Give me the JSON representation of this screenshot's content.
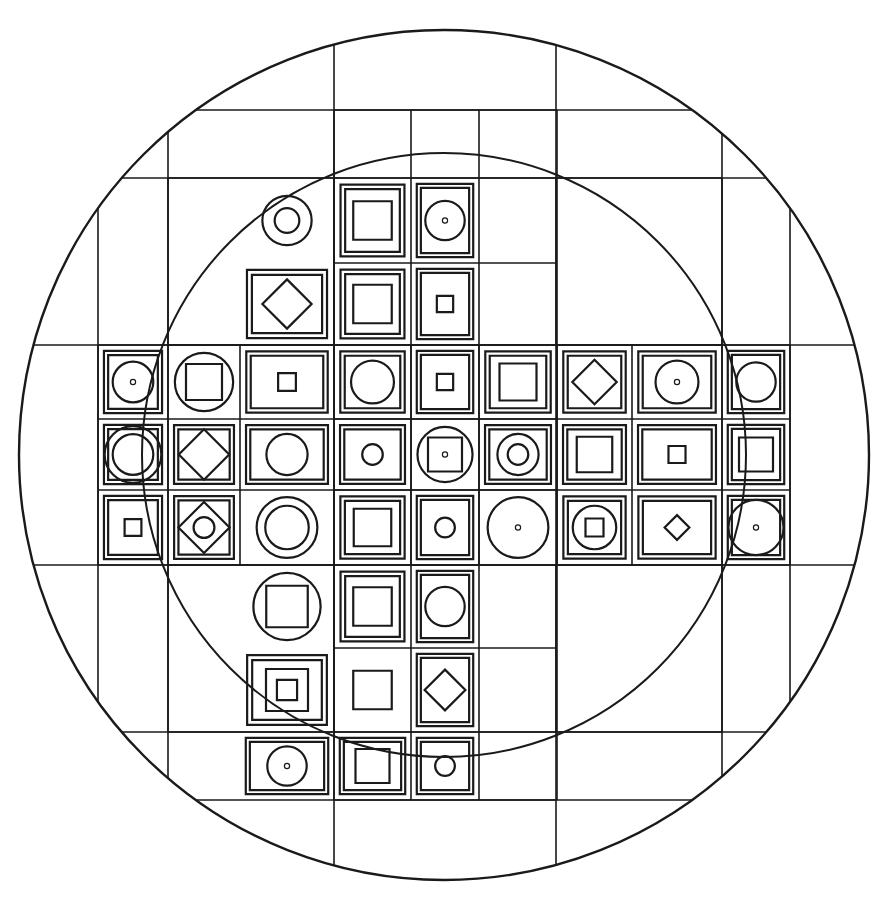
{
  "artwork": {
    "title": "Geometric Mandala Colouring Page",
    "type": "line-art",
    "palette": {
      "background": "#ffffff",
      "ink": "#1a1a1a"
    },
    "canvas": {
      "width": 889,
      "height": 909
    }
  },
  "geometry": {
    "outer_circle": {
      "cx": 444,
      "cy": 455,
      "r": 425,
      "stroke_width": 2.4
    },
    "inner_arc_circle": {
      "cx": 444,
      "cy": 455,
      "r": 302,
      "stroke_width": 2.0
    },
    "corner_squares": [
      {
        "name": "top-left-corner-square",
        "x": 168,
        "y": 178,
        "width": 166,
        "height": 167
      },
      {
        "name": "top-right-corner-square",
        "x": 556,
        "y": 178,
        "width": 166,
        "height": 167
      },
      {
        "name": "bottom-left-corner-square",
        "x": 168,
        "y": 565,
        "width": 166,
        "height": 167
      },
      {
        "name": "bottom-right-corner-square",
        "x": 556,
        "y": 565,
        "width": 166,
        "height": 167
      }
    ],
    "frame_lines": {
      "vertical": [
        98,
        168,
        334,
        556,
        722,
        790
      ],
      "horizontal": [
        110,
        178,
        345,
        565,
        732,
        800
      ]
    },
    "grid": {
      "columns": 9,
      "rows": 9,
      "x_edges": [
        98,
        168,
        240,
        334,
        411,
        479,
        557,
        632,
        722,
        790
      ],
      "y_edges": [
        110,
        178,
        263,
        345,
        419,
        490,
        565,
        648,
        732,
        800
      ],
      "arm_cols": [
        3,
        4,
        5
      ],
      "arm_rows": [
        3,
        4,
        5
      ],
      "description": "Plus/cross shaped tile field: full 9 columns across rows 3-5, full 9 rows within columns 3-5. Corner 3x3 blocks are empty and filled with arcs and nested rectangles."
    }
  },
  "cells": [
    {
      "id": "r0c4",
      "row": 0,
      "col": 4,
      "motifs": [
        "circle"
      ]
    },
    {
      "id": "r1c3",
      "row": 1,
      "col": 3,
      "motifs": [
        "circle",
        "circle-small"
      ]
    },
    {
      "id": "r1c4",
      "row": 1,
      "col": 4,
      "motifs": [
        "square-double",
        "square"
      ]
    },
    {
      "id": "r1c5",
      "row": 1,
      "col": 5,
      "motifs": [
        "square-double",
        "circle",
        "dot"
      ]
    },
    {
      "id": "r2c3",
      "row": 2,
      "col": 3,
      "motifs": [
        "square-double",
        "diamond"
      ]
    },
    {
      "id": "r2c4",
      "row": 2,
      "col": 4,
      "motifs": [
        "square-double",
        "square"
      ]
    },
    {
      "id": "r2c5",
      "row": 2,
      "col": 5,
      "motifs": [
        "square-double",
        "square-small"
      ]
    },
    {
      "id": "r3c0",
      "row": 3,
      "col": 0,
      "motifs": []
    },
    {
      "id": "r3c1",
      "row": 3,
      "col": 1,
      "motifs": [
        "square-double",
        "circle",
        "dot"
      ]
    },
    {
      "id": "r3c2",
      "row": 3,
      "col": 2,
      "motifs": [
        "circle-large",
        "square"
      ]
    },
    {
      "id": "r3c3",
      "row": 3,
      "col": 3,
      "motifs": [
        "square-double",
        "square-small"
      ]
    },
    {
      "id": "r3c4",
      "row": 3,
      "col": 4,
      "motifs": [
        "square-double",
        "circle"
      ]
    },
    {
      "id": "r3c5",
      "row": 3,
      "col": 5,
      "motifs": [
        "square-double",
        "square-small"
      ]
    },
    {
      "id": "r3c6",
      "row": 3,
      "col": 6,
      "motifs": [
        "square-double",
        "square"
      ]
    },
    {
      "id": "r3c7",
      "row": 3,
      "col": 7,
      "motifs": [
        "square-double",
        "diamond"
      ]
    },
    {
      "id": "r3c8",
      "row": 3,
      "col": 8,
      "motifs": [
        "square-double",
        "circle",
        "dot"
      ]
    },
    {
      "id": "r3c9",
      "row": 3,
      "col": 9,
      "motifs": [
        "square-double",
        "circle"
      ]
    },
    {
      "id": "r4c0",
      "row": 4,
      "col": 0,
      "motifs": [
        "circle"
      ]
    },
    {
      "id": "r4c1",
      "row": 4,
      "col": 1,
      "motifs": [
        "square-double",
        "circle-large",
        "circle"
      ]
    },
    {
      "id": "r4c2",
      "row": 4,
      "col": 2,
      "motifs": [
        "square-double",
        "diamond-large"
      ]
    },
    {
      "id": "r4c3",
      "row": 4,
      "col": 3,
      "motifs": [
        "square-double",
        "circle"
      ]
    },
    {
      "id": "r4c4",
      "row": 4,
      "col": 4,
      "motifs": [
        "square-double",
        "circle-small"
      ]
    },
    {
      "id": "r4c5",
      "row": 4,
      "col": 5,
      "motifs": [
        "circle-large",
        "square",
        "dot"
      ]
    },
    {
      "id": "r4c6",
      "row": 4,
      "col": 6,
      "motifs": [
        "square-double",
        "circle",
        "circle-small"
      ]
    },
    {
      "id": "r4c7",
      "row": 4,
      "col": 7,
      "motifs": [
        "square-double",
        "square"
      ]
    },
    {
      "id": "r4c8",
      "row": 4,
      "col": 8,
      "motifs": [
        "square-double",
        "square-small"
      ]
    },
    {
      "id": "r4c9",
      "row": 4,
      "col": 9,
      "motifs": [
        "square-double",
        "square"
      ]
    },
    {
      "id": "r4c10",
      "row": 4,
      "col": 10,
      "motifs": [
        "circle"
      ]
    },
    {
      "id": "r5c1",
      "row": 5,
      "col": 1,
      "motifs": [
        "square-double",
        "square-small"
      ]
    },
    {
      "id": "r5c2",
      "row": 5,
      "col": 2,
      "motifs": [
        "square-double",
        "diamond-large",
        "circle-small"
      ]
    },
    {
      "id": "r5c3",
      "row": 5,
      "col": 3,
      "motifs": [
        "circle-large",
        "circle"
      ]
    },
    {
      "id": "r5c4",
      "row": 5,
      "col": 4,
      "motifs": [
        "square-double",
        "square"
      ]
    },
    {
      "id": "r5c5",
      "row": 5,
      "col": 5,
      "motifs": [
        "square-double",
        "circle-small"
      ]
    },
    {
      "id": "r5c6",
      "row": 5,
      "col": 6,
      "motifs": [
        "circle-large",
        "dot"
      ]
    },
    {
      "id": "r5c7",
      "row": 5,
      "col": 7,
      "motifs": [
        "square-double",
        "circle",
        "square-small"
      ]
    },
    {
      "id": "r5c8",
      "row": 5,
      "col": 8,
      "motifs": [
        "square-double",
        "diamond-small"
      ]
    },
    {
      "id": "r5c9",
      "row": 5,
      "col": 9,
      "motifs": [
        "square-double",
        "circle-large",
        "dot"
      ]
    },
    {
      "id": "r6c3",
      "row": 6,
      "col": 3,
      "motifs": [
        "circle-large",
        "square"
      ]
    },
    {
      "id": "r6c4",
      "row": 6,
      "col": 4,
      "motifs": [
        "square-double",
        "square"
      ]
    },
    {
      "id": "r6c5",
      "row": 6,
      "col": 5,
      "motifs": [
        "square-double",
        "circle"
      ]
    },
    {
      "id": "r7c3",
      "row": 7,
      "col": 3,
      "motifs": [
        "square-double",
        "square",
        "square-small"
      ]
    },
    {
      "id": "r7c4",
      "row": 7,
      "col": 4,
      "motifs": [
        "square"
      ]
    },
    {
      "id": "r7c5",
      "row": 7,
      "col": 5,
      "motifs": [
        "square-double",
        "diamond"
      ]
    },
    {
      "id": "r8c3",
      "row": 8,
      "col": 3,
      "motifs": [
        "square-double",
        "circle",
        "dot"
      ]
    },
    {
      "id": "r8c4",
      "row": 8,
      "col": 4,
      "motifs": [
        "square-double",
        "square"
      ]
    },
    {
      "id": "r8c5",
      "row": 8,
      "col": 5,
      "motifs": [
        "square-double",
        "circle-small"
      ]
    },
    {
      "id": "r9c4",
      "row": 9,
      "col": 4,
      "motifs": [
        "circle"
      ]
    }
  ],
  "motif_legend": {
    "circle": "medium circle inscribed in the tile",
    "circle-large": "large circle overflowing toward tile edges",
    "circle-small": "small circle near tile centre",
    "square": "single square inset in the tile",
    "square-double": "double-lined square frame hugging the tile border",
    "square-small": "small square at tile centre",
    "diamond": "rotated square (diamond) inscribed in the inner square",
    "diamond-large": "large rotated square touching the inner square edges",
    "diamond-small": "small rotated square at tile centre",
    "dot": "tiny filled dot marking the tile centre"
  }
}
